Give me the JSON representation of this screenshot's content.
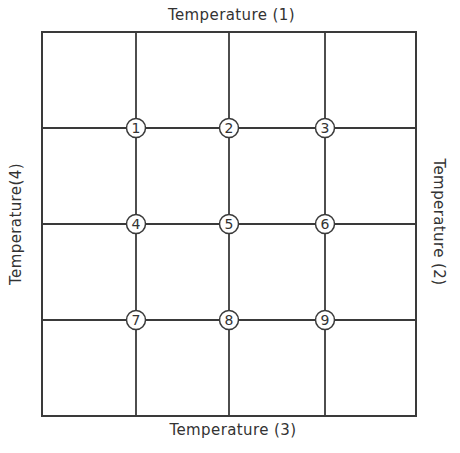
{
  "diagram": {
    "type": "grid-node-diagram",
    "boundary_labels": {
      "top": "Temperature (1)",
      "right": "Temperature (2)",
      "bottom": "Temperature (3)",
      "left": "Temperature(4)"
    },
    "grid": {
      "rows": 4,
      "columns": 4,
      "outer_frame": {
        "left": 42,
        "top": 32,
        "right": 416,
        "bottom": 416
      },
      "vertical_lines_x": [
        136,
        229,
        325
      ],
      "horizontal_lines_y": [
        128,
        224,
        320
      ]
    },
    "nodes": [
      {
        "id": "1",
        "label": "1",
        "row": 1,
        "col": 1
      },
      {
        "id": "2",
        "label": "2",
        "row": 1,
        "col": 2
      },
      {
        "id": "3",
        "label": "3",
        "row": 1,
        "col": 3
      },
      {
        "id": "4",
        "label": "4",
        "row": 2,
        "col": 1
      },
      {
        "id": "5",
        "label": "5",
        "row": 2,
        "col": 2
      },
      {
        "id": "6",
        "label": "6",
        "row": 2,
        "col": 3
      },
      {
        "id": "7",
        "label": "7",
        "row": 3,
        "col": 1
      },
      {
        "id": "8",
        "label": "8",
        "row": 3,
        "col": 2
      },
      {
        "id": "9",
        "label": "9",
        "row": 3,
        "col": 3
      }
    ],
    "colors": {
      "line": "#3a3a3a",
      "text": "#333333",
      "background": "#ffffff",
      "node_fill": "#ffffff"
    }
  }
}
